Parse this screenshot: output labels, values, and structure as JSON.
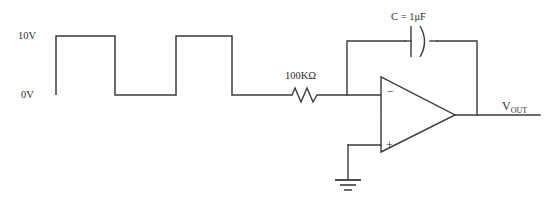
{
  "diagram": {
    "type": "schematic",
    "background_color": "#ffffff",
    "line_color": "#3b3b3b",
    "text_color": "#2e2e2e"
  },
  "waveform": {
    "name": "input-square-wave",
    "high_label": "10V",
    "low_label": "0V",
    "high_value": 10,
    "low_value": 0,
    "units": "V",
    "shape": "square",
    "pulse_count": 2,
    "points": "56,95 56,36 115,36 115,95 176,95 176,36 232,36 232,95 288,95"
  },
  "components": {
    "resistor": {
      "name": "input-resistor",
      "label": "100KΩ",
      "value": "100K",
      "units": "Ω",
      "designator": "R"
    },
    "capacitor": {
      "name": "feedback-capacitor",
      "label": "C = 1μF",
      "designator": "C",
      "value": "1",
      "units": "μF",
      "style": "polarized"
    },
    "opamp": {
      "name": "operational-amplifier",
      "inverting_label": "−",
      "noninverting_label": "+"
    },
    "ground": {
      "name": "ground-symbol",
      "label": ""
    }
  },
  "nodes": {
    "output": {
      "name": "output-node",
      "label_main": "V",
      "label_sub": "OUT"
    }
  },
  "geometry": {
    "input_wire": "288,95 288,95",
    "resistor_zigzag": "288,95 292,95 295,88 301,102 307,88 313,102 317,95 320,95 347,95",
    "node_to_opamp_minus": "347,95 381,95",
    "feedback_up": "347,95 347,41 405,41",
    "feedback_right": "437,41 477,41 477,115",
    "opamp_out_wire": "455,115 540,115",
    "gnd_wire": "348,145 348,180",
    "gnd_to_plus": "348,145 381,145",
    "cap_plate_left": "411,26 411,57",
    "cap_plate_right_path": "M 420 26 Q 429 41.5 420 57",
    "cap_lead_left": "405,41 411,41",
    "cap_lead_right": "430,41 437,41",
    "opamp_triangle": "381,77 381,152 455,115",
    "gnd_bars": [
      {
        "y": 180,
        "half_width": 13,
        "width": 1.8
      },
      {
        "y": 185,
        "half_width": 8,
        "width": 1.6
      },
      {
        "y": 190,
        "half_width": 4,
        "width": 1.5
      }
    ]
  },
  "labels": {
    "high": {
      "text": "10V",
      "x": 18,
      "y": 39
    },
    "low": {
      "text": "0V",
      "x": 21,
      "y": 98
    },
    "resistor": {
      "text": "100KΩ",
      "x": 285,
      "y": 79
    },
    "capacitor": {
      "text": "C = 1μF",
      "x": 391,
      "y": 20
    },
    "minus": {
      "text": "−",
      "x": 387,
      "y": 95
    },
    "plus": {
      "text": "+",
      "x": 386,
      "y": 149
    },
    "vout": {
      "x": 502,
      "y": 110
    }
  }
}
